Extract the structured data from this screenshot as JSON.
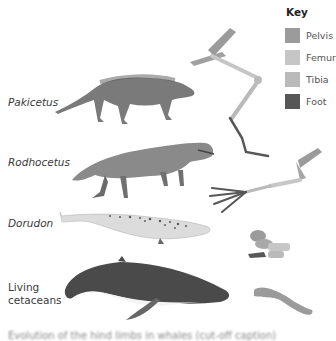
{
  "key": {
    "title": "Key",
    "items": [
      {
        "label": "Pelvis",
        "color": "#9b9b9b"
      },
      {
        "label": "Femur",
        "color": "#c6c6c6"
      },
      {
        "label": "Tibia",
        "color": "#bababa"
      },
      {
        "label": "Foot",
        "color": "#575757"
      }
    ]
  },
  "species": [
    {
      "name": "Pakicetus",
      "italic": true
    },
    {
      "name": "Rodhocetus",
      "italic": true
    },
    {
      "name": "Dorudon",
      "italic": true
    },
    {
      "name": "Living cetaceans",
      "line1": "Living",
      "line2": "cetaceans",
      "italic": false
    }
  ],
  "caption": "Evolution of the hind limbs in whales (cut-off caption)"
}
